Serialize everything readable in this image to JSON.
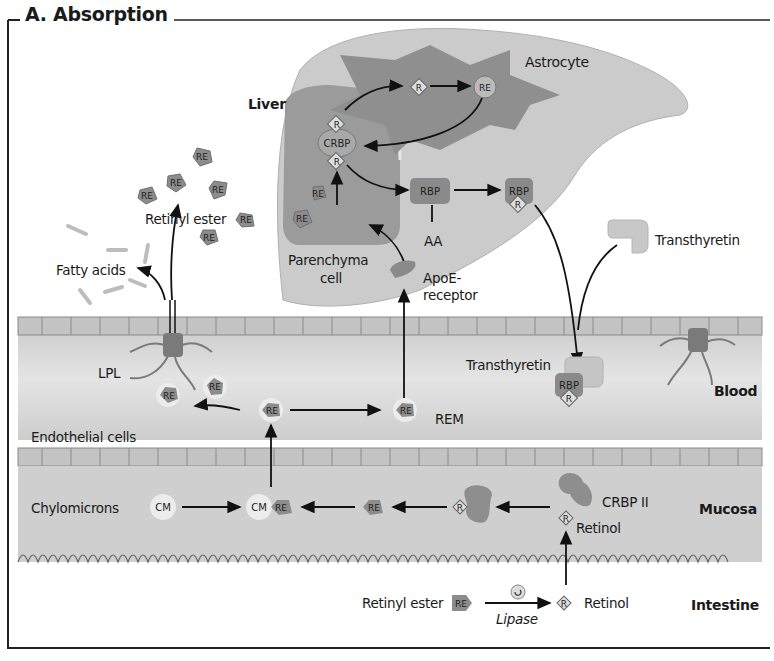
{
  "figure": {
    "title": "A. Absorption"
  },
  "regions": {
    "liver": "Liver",
    "blood": "Blood",
    "mucosa": "Mucosa",
    "intestine": "Intestine"
  },
  "labels": {
    "astrocyte": "Astrocyte",
    "parenchyma_cell": "Parenchyma\ncell",
    "parenchyma_line1": "Parenchyma",
    "parenchyma_line2": "cell",
    "aa": "AA",
    "apoe_receptor_line1": "ApoE-",
    "apoe_receptor_line2": "receptor",
    "retinyl_ester_top": "Retinyl ester",
    "fatty_acids": "Fatty acids",
    "transthyretin_free": "Transthyretin",
    "transthyretin_blood": "Transthyretin",
    "lpl": "LPL",
    "rem": "REM",
    "endothelial_cells": "Endothelial cells",
    "chylomicrons": "Chylomicrons",
    "crbp_ii": "CRBP II",
    "retinol_mucosa": "Retinol",
    "retinyl_ester_intestine": "Retinyl ester",
    "lipase": "Lipase",
    "retinol_intestine": "Retinol"
  },
  "molecule_tags": {
    "retinol": "R",
    "retinyl_ester": "RE",
    "crbp": "CRBP",
    "rbp": "RBP",
    "chylomicron": "CM"
  },
  "colors": {
    "liver_outer": "#c9c9c9",
    "liver_inner": "#9a9a9a",
    "astrocyte": "#8e8e8e",
    "blood_band": "#d6d6d6",
    "mucosa_band": "#cfcfcf",
    "cell_row": "#c4c4c4",
    "molecule": "#8c8c8c",
    "arrow": "#111111",
    "border": "#222222"
  }
}
